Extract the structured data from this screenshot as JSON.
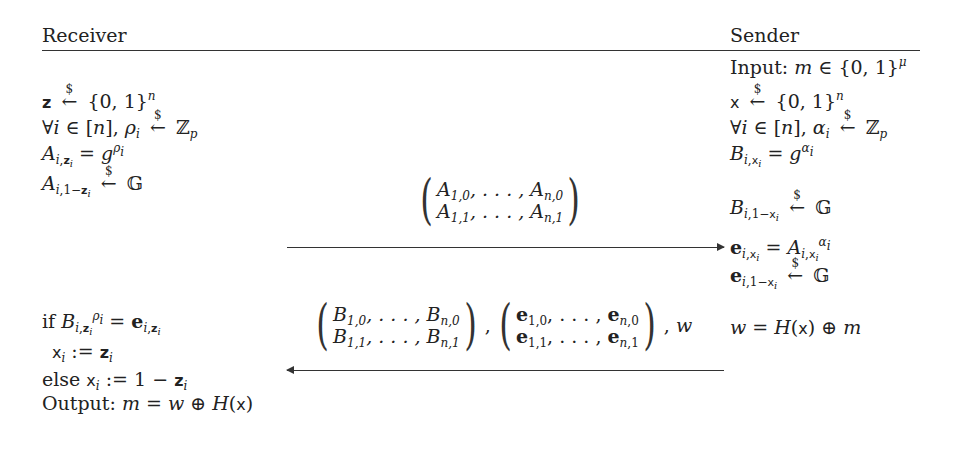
{
  "header": {
    "receiver_label": "Receiver",
    "sender_label": "Sender"
  },
  "sender": {
    "input_prefix": "Input: ",
    "input_math": "m ∈ {0, 1}",
    "input_sup": "μ",
    "steps": [
      "x ←$ {0,1}^n",
      "∀i ∈ [n], α_i ←$ Z_p",
      "B_{i,x_i} = g^{α_i}",
      "B_{i,1−x_i} ←$ G",
      "e_{i,x_i} = A_{i,x_i}^{α_i}",
      "e_{i,1−x_i} ←$ G",
      "w = H(x) ⊕ m"
    ]
  },
  "receiver": {
    "steps": [
      "z ←$ {0,1}^n",
      "∀i ∈ [n], ρ_i ←$ Z_p",
      "A_{i,z_i} = g^{ρ_i}",
      "A_{i,1−z_i} ←$ G",
      "if B_{i,z_i}^{ρ_i} = e_{i,z_i}",
      "x_i := z_i",
      "else x_i := 1 − z_i",
      "Output: m = w ⊕ H(x)"
    ],
    "if_prefix": "if ",
    "else_prefix": "else ",
    "output_prefix": "Output: "
  },
  "messages": [
    {
      "direction": "receiver-to-sender",
      "content": "(A_{1,0},…,A_{n,0}; A_{1,1},…,A_{n,1})"
    },
    {
      "direction": "sender-to-receiver",
      "content": "(B_{1,0},…,B_{n,0}; B_{1,1},…,B_{n,1}), (e_{1,0},…,e_{n,0}; e_{1,1},…,e_{n,1}), w"
    }
  ],
  "symbols": {
    "dollar": "$",
    "sample_arrow": "←",
    "zp": "ℤ",
    "group": "𝔾"
  }
}
